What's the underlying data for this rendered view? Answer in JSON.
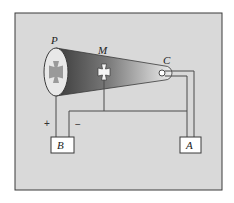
{
  "diagram": {
    "colors": {
      "background": "#d9d9d9",
      "frame": "#3a3a3a",
      "wire": "#4a4a4a",
      "tube_dark": "#3c3c3c",
      "tube_light": "#e6e6e6",
      "screen_fill": "#e8e8e8",
      "shadow_cross": "#9a9a9a",
      "box_fill": "#ffffff"
    },
    "labels": {
      "screen": "P",
      "cross": "M",
      "cathode": "C",
      "battery": "B",
      "power_supply": "A",
      "positive": "+",
      "negative": "−"
    },
    "components": [
      {
        "id": "P",
        "name": "fluorescent screen / anode",
        "shape": "ellipse"
      },
      {
        "id": "M",
        "name": "Maltese cross",
        "shape": "cross"
      },
      {
        "id": "C",
        "name": "cathode",
        "shape": "circle"
      },
      {
        "id": "B",
        "name": "battery / supply",
        "shape": "box"
      },
      {
        "id": "A",
        "name": "heater supply",
        "shape": "box"
      }
    ]
  }
}
